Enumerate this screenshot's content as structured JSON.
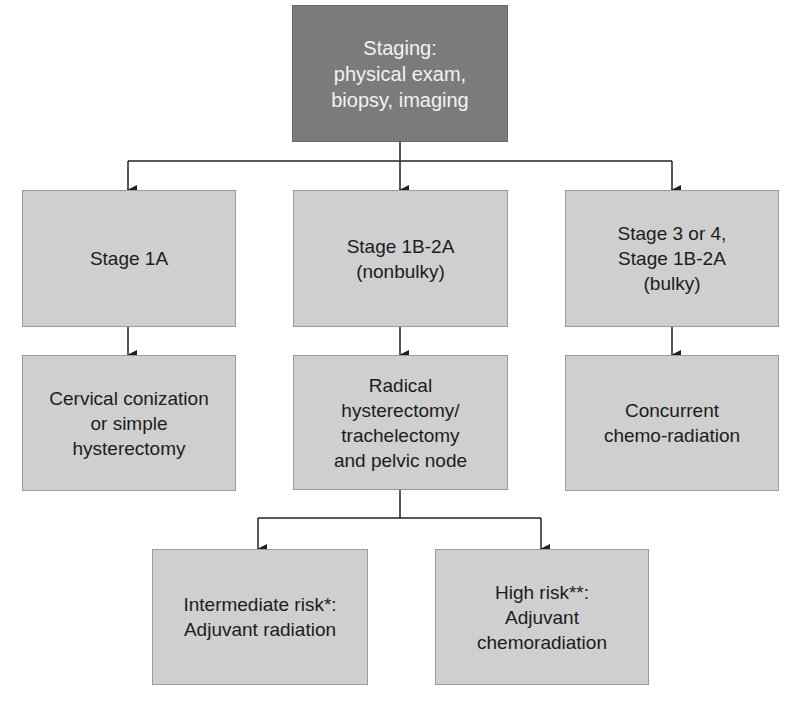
{
  "diagram": {
    "type": "flowchart",
    "colors": {
      "root_fill": "#7b7b7b",
      "node_fill": "#cfcfcf",
      "root_text": "#f2f2f2",
      "node_text": "#1c1c1c",
      "connector": "#222222"
    },
    "nodes": {
      "staging": {
        "label": "Staging:\nphysical exam,\nbiopsy, imaging"
      },
      "stage_1a": {
        "label": "Stage 1A"
      },
      "stage_1b_2a_nonbulky": {
        "label": "Stage 1B-2A\n(nonbulky)"
      },
      "stage_3_4_bulky": {
        "label": "Stage 3 or 4,\nStage 1B-2A\n(bulky)"
      },
      "conization": {
        "label": "Cervical conization\nor simple\nhysterectomy"
      },
      "radical_hysterectomy": {
        "label": "Radical\nhysterectomy/\ntrachelectomy\nand pelvic node"
      },
      "chemoradiation": {
        "label": "Concurrent\nchemo-radiation"
      },
      "intermediate_risk": {
        "label": "Intermediate risk*:\nAdjuvant radiation"
      },
      "high_risk": {
        "label": "High risk**:\nAdjuvant\nchemoradiation"
      }
    },
    "edges": [
      {
        "from": "staging",
        "to": "stage_1a"
      },
      {
        "from": "staging",
        "to": "stage_1b_2a_nonbulky"
      },
      {
        "from": "staging",
        "to": "stage_3_4_bulky"
      },
      {
        "from": "stage_1a",
        "to": "conization"
      },
      {
        "from": "stage_1b_2a_nonbulky",
        "to": "radical_hysterectomy"
      },
      {
        "from": "stage_3_4_bulky",
        "to": "chemoradiation"
      },
      {
        "from": "radical_hysterectomy",
        "to": "intermediate_risk"
      },
      {
        "from": "radical_hysterectomy",
        "to": "high_risk"
      }
    ]
  }
}
